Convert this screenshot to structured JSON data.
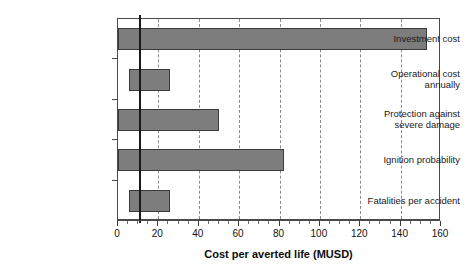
{
  "chart_data": {
    "type": "bar",
    "orientation": "horizontal",
    "title": "",
    "xlabel": "Cost per averted life (MUSD)",
    "ylabel": "",
    "categories": [
      "Investment cost",
      "Operational cost annually",
      "Protection against severe damage",
      "Ignition probability",
      "Fatalities per accident"
    ],
    "category_lines": [
      [
        "Investment cost"
      ],
      [
        "Operational cost",
        "annually"
      ],
      [
        "Protection against",
        "severe damage"
      ],
      [
        "Ignition probability"
      ],
      [
        "Fatalities per accident"
      ]
    ],
    "bar_ranges": [
      {
        "category": "Investment cost",
        "start": 0,
        "end": 153
      },
      {
        "category": "Operational cost annually",
        "start": 5.5,
        "end": 26
      },
      {
        "category": "Protection against severe damage",
        "start": 0,
        "end": 50
      },
      {
        "category": "Ignition probability",
        "start": 0,
        "end": 82
      },
      {
        "category": "Fatalities per accident",
        "start": 5.5,
        "end": 26
      }
    ],
    "values": [
      153,
      26,
      50,
      82,
      26
    ],
    "reference_line": 11,
    "xlim": [
      0,
      160
    ],
    "xticks": [
      0,
      20,
      40,
      60,
      80,
      100,
      120,
      140,
      160
    ],
    "xtick_labels": [
      "0",
      "20",
      "40",
      "60",
      "80",
      "100",
      "120",
      "140",
      "160"
    ],
    "minor_tick_step": 5,
    "grid": "vertical-dashed",
    "gridlines_at": [
      20,
      40,
      60,
      80,
      100,
      120,
      140
    ],
    "legend": null,
    "colors": {
      "bar_fill": "#7d7d7d",
      "bar_edge": "#3a3a3a",
      "reference_line": "#1a1a1a",
      "grid": "#8a8a8a",
      "axis": "#4a4a4a",
      "text": "#111111",
      "background": "#ffffff"
    }
  }
}
